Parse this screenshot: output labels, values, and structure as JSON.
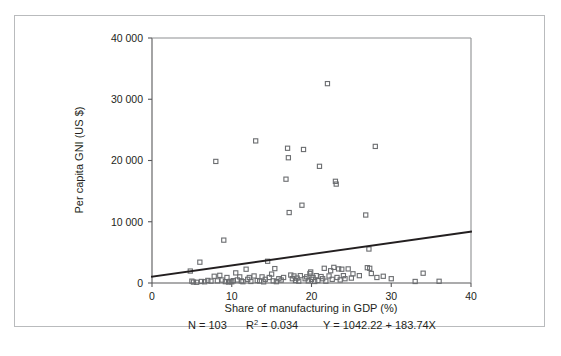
{
  "figure": {
    "background_color": "#ffffff",
    "border_color": "#b9bbbd",
    "axis_color": "#58585a",
    "marker_color": "#6b6d70",
    "line_color": "#231f20"
  },
  "chart_data": {
    "type": "scatter",
    "title": "",
    "xlabel": "Share of manufacturing in GDP (%)",
    "ylabel": "Per capita GNI (US $)",
    "xlim": [
      0,
      40
    ],
    "ylim": [
      0,
      40000
    ],
    "xticks": [
      0,
      10,
      20,
      30,
      40
    ],
    "xtick_labels": [
      "0",
      "10",
      "20",
      "30",
      "40"
    ],
    "yticks": [
      0,
      10000,
      20000,
      30000,
      40000
    ],
    "ytick_labels": [
      "0",
      "10 000",
      "20 000",
      "30 000",
      "40 000"
    ],
    "grid": false,
    "legend": "none",
    "n": 103,
    "r_squared": 0.034,
    "fit_intercept": 1042.22,
    "fit_slope": 183.74,
    "fit_line": {
      "x_start": 0,
      "y_start": 1042.22,
      "x_end": 40,
      "y_end": 8391.82
    },
    "annotations": [
      "N = 103",
      "R2 = 0.034",
      "Y = 1042.22 + 183.74X"
    ],
    "caption": {
      "n_label": "N = 103",
      "r2_prefix": "R",
      "r2_sup": "2",
      "r2_value": " = 0.034",
      "equation": "Y = 1042.22 + 183.74X"
    },
    "points": [
      [
        4.8,
        1950
      ],
      [
        5.0,
        300
      ],
      [
        5.2,
        150
      ],
      [
        5.6,
        120
      ],
      [
        6.0,
        3400
      ],
      [
        6.2,
        250
      ],
      [
        6.6,
        200
      ],
      [
        7.0,
        420
      ],
      [
        7.4,
        300
      ],
      [
        7.8,
        1100
      ],
      [
        8.0,
        19850
      ],
      [
        8.2,
        350
      ],
      [
        8.5,
        1250
      ],
      [
        8.8,
        480
      ],
      [
        9.0,
        7000
      ],
      [
        9.2,
        220
      ],
      [
        9.4,
        900
      ],
      [
        9.6,
        160
      ],
      [
        9.8,
        260
      ],
      [
        10.0,
        200
      ],
      [
        10.2,
        380
      ],
      [
        10.5,
        1650
      ],
      [
        10.7,
        500
      ],
      [
        11.0,
        1000
      ],
      [
        11.2,
        330
      ],
      [
        11.4,
        210
      ],
      [
        11.8,
        2250
      ],
      [
        12.0,
        600
      ],
      [
        12.2,
        900
      ],
      [
        12.4,
        250
      ],
      [
        12.8,
        1150
      ],
      [
        13.0,
        23200
      ],
      [
        13.2,
        400
      ],
      [
        13.5,
        320
      ],
      [
        13.8,
        1000
      ],
      [
        14.0,
        190
      ],
      [
        14.2,
        600
      ],
      [
        14.5,
        3550
      ],
      [
        14.7,
        900
      ],
      [
        15.0,
        1450
      ],
      [
        15.2,
        350
      ],
      [
        15.4,
        2350
      ],
      [
        15.6,
        220
      ],
      [
        15.9,
        700
      ],
      [
        16.2,
        480
      ],
      [
        16.5,
        900
      ],
      [
        16.8,
        16950
      ],
      [
        17.0,
        22000
      ],
      [
        17.1,
        20450
      ],
      [
        17.2,
        11500
      ],
      [
        17.4,
        1300
      ],
      [
        17.6,
        700
      ],
      [
        17.8,
        1150
      ],
      [
        18.0,
        400
      ],
      [
        18.2,
        800
      ],
      [
        18.4,
        300
      ],
      [
        18.6,
        1200
      ],
      [
        18.8,
        12700
      ],
      [
        19.0,
        21800
      ],
      [
        19.2,
        700
      ],
      [
        19.4,
        1000
      ],
      [
        19.6,
        350
      ],
      [
        19.8,
        1550
      ],
      [
        20.0,
        600
      ],
      [
        20.2,
        900
      ],
      [
        20.4,
        250
      ],
      [
        20.6,
        1200
      ],
      [
        20.8,
        400
      ],
      [
        21.0,
        19050
      ],
      [
        21.2,
        1050
      ],
      [
        21.4,
        700
      ],
      [
        21.6,
        2400
      ],
      [
        21.8,
        300
      ],
      [
        22.0,
        32550
      ],
      [
        22.2,
        1150
      ],
      [
        22.4,
        2000
      ],
      [
        22.6,
        600
      ],
      [
        22.8,
        2550
      ],
      [
        23.0,
        16600
      ],
      [
        23.1,
        16150
      ],
      [
        23.2,
        900
      ],
      [
        23.4,
        2300
      ],
      [
        23.6,
        500
      ],
      [
        23.8,
        2250
      ],
      [
        24.0,
        1200
      ],
      [
        24.2,
        700
      ],
      [
        24.6,
        2300
      ],
      [
        25.0,
        800
      ],
      [
        25.2,
        1500
      ],
      [
        26.0,
        1200
      ],
      [
        26.8,
        11100
      ],
      [
        27.0,
        2500
      ],
      [
        27.2,
        5550
      ],
      [
        27.3,
        2400
      ],
      [
        27.5,
        1550
      ],
      [
        28.0,
        22300
      ],
      [
        28.2,
        900
      ],
      [
        29.0,
        1100
      ],
      [
        30.0,
        700
      ],
      [
        33.0,
        250
      ],
      [
        34.0,
        1600
      ],
      [
        36.0,
        280
      ],
      [
        19.9,
        1800
      ]
    ]
  }
}
